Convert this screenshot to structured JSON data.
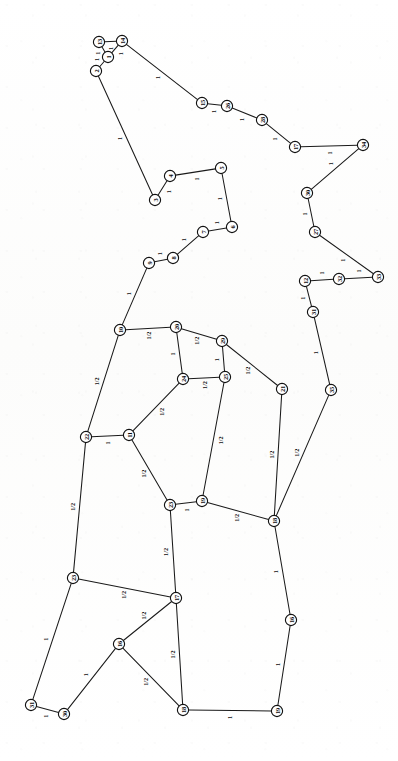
{
  "figure": {
    "type": "graph-diagram",
    "title": "",
    "orientation": "labels rotated 90 degrees counter-clockwise",
    "background_color": "#fdfdfc",
    "ink_color": "#1a1a1a",
    "node_fill": "#ffffff",
    "node_radius": 5.6,
    "weight_values": [
      "1",
      "1/2"
    ]
  },
  "chart_data": {
    "type": "diagram",
    "node_count": 35,
    "edge_count": 43,
    "nodes": [
      {
        "id": "n13",
        "label": "13",
        "x": 99,
        "y": 42
      },
      {
        "id": "n14",
        "label": "14",
        "x": 122,
        "y": 41
      },
      {
        "id": "n1",
        "label": "1",
        "x": 108,
        "y": 57
      },
      {
        "id": "n2",
        "label": "2",
        "x": 96,
        "y": 71
      },
      {
        "id": "n15",
        "label": "15",
        "x": 202,
        "y": 103
      },
      {
        "id": "n26",
        "label": "26",
        "x": 227,
        "y": 106
      },
      {
        "id": "n28",
        "label": "28",
        "x": 262,
        "y": 120
      },
      {
        "id": "n17",
        "label": "17",
        "x": 295,
        "y": 147
      },
      {
        "id": "n34",
        "label": "34",
        "x": 363,
        "y": 145
      },
      {
        "id": "n30",
        "label": "30",
        "x": 307,
        "y": 193
      },
      {
        "id": "n27",
        "label": "27",
        "x": 315,
        "y": 232
      },
      {
        "id": "n4",
        "label": "4",
        "x": 170,
        "y": 176
      },
      {
        "id": "n5",
        "label": "5",
        "x": 221,
        "y": 168
      },
      {
        "id": "n3",
        "label": "3",
        "x": 155,
        "y": 200
      },
      {
        "id": "n6",
        "label": "6",
        "x": 232,
        "y": 227
      },
      {
        "id": "n7",
        "label": "7",
        "x": 203,
        "y": 232
      },
      {
        "id": "n8",
        "label": "8",
        "x": 173,
        "y": 258
      },
      {
        "id": "n9",
        "label": "9",
        "x": 149,
        "y": 263
      },
      {
        "id": "n12",
        "label": "12",
        "x": 305,
        "y": 281
      },
      {
        "id": "n32",
        "label": "32",
        "x": 339,
        "y": 279
      },
      {
        "id": "n33",
        "label": "33",
        "x": 378,
        "y": 277
      },
      {
        "id": "n31",
        "label": "31",
        "x": 313,
        "y": 312
      },
      {
        "id": "n10",
        "label": "10",
        "x": 120,
        "y": 330
      },
      {
        "id": "n20",
        "label": "20",
        "x": 176,
        "y": 327
      },
      {
        "id": "n29",
        "label": "29",
        "x": 222,
        "y": 341
      },
      {
        "id": "n24",
        "label": "24",
        "x": 183,
        "y": 379
      },
      {
        "id": "n25",
        "label": "25",
        "x": 225,
        "y": 377
      },
      {
        "id": "n21",
        "label": "21",
        "x": 282,
        "y": 389
      },
      {
        "id": "n35",
        "label": "35",
        "x": 331,
        "y": 390
      },
      {
        "id": "n22",
        "label": "22",
        "x": 86,
        "y": 437
      },
      {
        "id": "n11",
        "label": "11",
        "x": 129,
        "y": 435
      },
      {
        "id": "n23",
        "label": "23",
        "x": 170,
        "y": 505
      },
      {
        "id": "n19",
        "label": "19",
        "x": 202,
        "y": 501
      },
      {
        "id": "n18",
        "label": "18",
        "x": 274,
        "y": 521
      },
      {
        "id": "n16",
        "label": "16",
        "x": 291,
        "y": 620
      },
      {
        "id": "nA",
        "label": "23",
        "x": 73,
        "y": 578
      },
      {
        "id": "nB",
        "label": "17",
        "x": 176,
        "y": 598
      },
      {
        "id": "nC",
        "label": "16",
        "x": 119,
        "y": 644
      },
      {
        "id": "nD",
        "label": "31",
        "x": 31,
        "y": 705
      },
      {
        "id": "nE",
        "label": "30",
        "x": 64,
        "y": 714
      },
      {
        "id": "nF",
        "label": "18",
        "x": 183,
        "y": 710
      },
      {
        "id": "nG",
        "label": "19",
        "x": 277,
        "y": 711
      }
    ],
    "edges": [
      {
        "from": "n13",
        "to": "n14",
        "weight": "1"
      },
      {
        "from": "n13",
        "to": "n1",
        "weight": "1"
      },
      {
        "from": "n1",
        "to": "n14",
        "weight": "1"
      },
      {
        "from": "n1",
        "to": "n2",
        "weight": "1"
      },
      {
        "from": "n14",
        "to": "n15",
        "weight": "1"
      },
      {
        "from": "n15",
        "to": "n26",
        "weight": "1"
      },
      {
        "from": "n26",
        "to": "n28",
        "weight": "1"
      },
      {
        "from": "n28",
        "to": "n17",
        "weight": "1"
      },
      {
        "from": "n17",
        "to": "n34",
        "weight": "1"
      },
      {
        "from": "n34",
        "to": "n30",
        "weight": "1"
      },
      {
        "from": "n30",
        "to": "n27",
        "weight": "1"
      },
      {
        "from": "n27",
        "to": "n33",
        "weight": "1"
      },
      {
        "from": "n33",
        "to": "n32",
        "weight": "1"
      },
      {
        "from": "n32",
        "to": "n12",
        "weight": "1"
      },
      {
        "from": "n12",
        "to": "n31",
        "weight": "1"
      },
      {
        "from": "n31",
        "to": "n35",
        "weight": "1"
      },
      {
        "from": "n2",
        "to": "n3",
        "weight": "1"
      },
      {
        "from": "n3",
        "to": "n4",
        "weight": "1"
      },
      {
        "from": "n4",
        "to": "n5",
        "weight": "1"
      },
      {
        "from": "n5",
        "to": "n6",
        "weight": "1"
      },
      {
        "from": "n6",
        "to": "n7",
        "weight": "1"
      },
      {
        "from": "n7",
        "to": "n8",
        "weight": "1"
      },
      {
        "from": "n8",
        "to": "n9",
        "weight": "1"
      },
      {
        "from": "n9",
        "to": "n10",
        "weight": "1"
      },
      {
        "from": "n10",
        "to": "n20",
        "weight": "1/2"
      },
      {
        "from": "n20",
        "to": "n29",
        "weight": "1/2"
      },
      {
        "from": "n29",
        "to": "n21",
        "weight": "1/2"
      },
      {
        "from": "n20",
        "to": "n24",
        "weight": "1"
      },
      {
        "from": "n29",
        "to": "n25",
        "weight": "1"
      },
      {
        "from": "n24",
        "to": "n25",
        "weight": "1/2"
      },
      {
        "from": "n10",
        "to": "n22",
        "weight": "1/2"
      },
      {
        "from": "n22",
        "to": "n11",
        "weight": "1"
      },
      {
        "from": "n11",
        "to": "n24",
        "weight": "1/2"
      },
      {
        "from": "n11",
        "to": "n23",
        "weight": "1/2"
      },
      {
        "from": "n23",
        "to": "n19",
        "weight": "1"
      },
      {
        "from": "n19",
        "to": "n25",
        "weight": "1/2"
      },
      {
        "from": "n19",
        "to": "n18",
        "weight": "1/2"
      },
      {
        "from": "n21",
        "to": "n18",
        "weight": "1/2"
      },
      {
        "from": "n35",
        "to": "n18",
        "weight": "1/2"
      },
      {
        "from": "n18",
        "to": "n16",
        "weight": "1"
      },
      {
        "from": "n22",
        "to": "nA",
        "weight": "1/2"
      },
      {
        "from": "n23",
        "to": "nB",
        "weight": "1/2"
      },
      {
        "from": "nA",
        "to": "nB",
        "weight": "1/2"
      },
      {
        "from": "nA",
        "to": "nD",
        "weight": "1"
      },
      {
        "from": "nB",
        "to": "nC",
        "weight": "1/2"
      },
      {
        "from": "nB",
        "to": "nF",
        "weight": "1/2"
      },
      {
        "from": "nC",
        "to": "nF",
        "weight": "1/2"
      },
      {
        "from": "nC",
        "to": "nE",
        "weight": "1"
      },
      {
        "from": "nD",
        "to": "nE",
        "weight": "1"
      },
      {
        "from": "nF",
        "to": "nG",
        "weight": "1"
      },
      {
        "from": "n16",
        "to": "nG",
        "weight": "1"
      }
    ]
  }
}
